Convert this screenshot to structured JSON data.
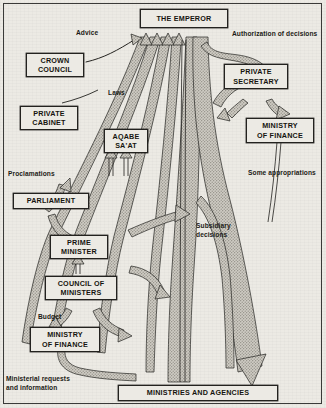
{
  "diagram": {
    "background_color": "#eceae4",
    "ink_color": "#23221f",
    "ribbon_fill": "#b9b6ae",
    "nodes": [
      {
        "id": "emperor",
        "lines": [
          "THE EMPEROR"
        ]
      },
      {
        "id": "crown-council",
        "lines": [
          "CROWN",
          "COUNCIL"
        ]
      },
      {
        "id": "private-cabinet",
        "lines": [
          "PRIVATE",
          "CABINET"
        ]
      },
      {
        "id": "aqabe-saat",
        "lines": [
          "AQABE",
          "SA'AT"
        ]
      },
      {
        "id": "parliament",
        "lines": [
          "PARLIAMENT"
        ]
      },
      {
        "id": "prime-minister",
        "lines": [
          "PRIME",
          "MINISTER"
        ]
      },
      {
        "id": "council-of-ministers",
        "lines": [
          "COUNCIL OF",
          "MINISTERS"
        ]
      },
      {
        "id": "ministry-of-finance-lower",
        "lines": [
          "MINISTRY",
          "OF FINANCE"
        ]
      },
      {
        "id": "private-secretary",
        "lines": [
          "PRIVATE",
          "SECRETARY"
        ]
      },
      {
        "id": "ministry-of-finance-upper",
        "lines": [
          "MINISTRY",
          "OF FINANCE"
        ]
      },
      {
        "id": "ministries-and-agencies",
        "lines": [
          "MINISTRIES AND AGENCIES"
        ]
      }
    ],
    "annotations": [
      {
        "id": "advice",
        "lines": [
          "Advice"
        ]
      },
      {
        "id": "authorization-of-decisions",
        "lines": [
          "Authorization of decisions"
        ]
      },
      {
        "id": "laws",
        "lines": [
          "Laws"
        ]
      },
      {
        "id": "proclamations",
        "lines": [
          "Proclamations"
        ]
      },
      {
        "id": "some-appropriations",
        "lines": [
          "Some appropriations"
        ]
      },
      {
        "id": "subsidiary-decisions",
        "lines": [
          "Subsidiary",
          "decisions"
        ]
      },
      {
        "id": "budget",
        "lines": [
          "Budget"
        ]
      },
      {
        "id": "ministerial-requests",
        "lines": [
          "Ministerial requests",
          "and information"
        ]
      }
    ]
  }
}
